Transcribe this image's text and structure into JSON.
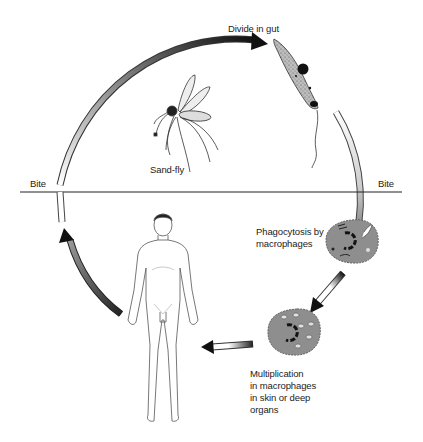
{
  "diagram": {
    "labels": {
      "divide_in_gut": "Divide in gut",
      "sand_fly": "Sand-fly",
      "bite_left": "Bite",
      "bite_right": "Bite",
      "phagocytosis": [
        "Phagocytosis by",
        "macrophages"
      ],
      "multiplication": [
        "Multiplication",
        "in macrophages",
        "in skin or deep",
        "organs"
      ]
    },
    "stages": [
      {
        "id": "sand-fly",
        "name": "Sand-fly"
      },
      {
        "id": "promastigote",
        "name": "Divide in gut"
      },
      {
        "id": "phagocytosis",
        "name": "Phagocytosis by macrophages"
      },
      {
        "id": "multiplication",
        "name": "Multiplication in macrophages in skin or deep organs"
      },
      {
        "id": "human-host",
        "name": "Human host"
      }
    ],
    "colors": {
      "arrow_dark": "#111111",
      "arrow_light": "#ffffff",
      "cell_fill": "#8a8a8a",
      "line": "#222222"
    }
  }
}
